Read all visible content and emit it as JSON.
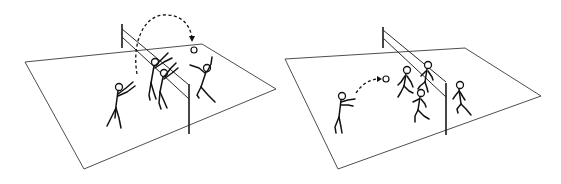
{
  "illustration": {
    "title": "",
    "panels": [
      {
        "id": "left",
        "description": "Volleyball spike/block at the net: one player sets, two players block at the net, one attacker on far side jumps for the ball",
        "players": 4,
        "ball": true,
        "trajectory": "dashed high arc over net with arrowhead down to ball"
      },
      {
        "id": "right",
        "description": "Volleyball pass: player on left passes the ball in a short dashed arc toward teammates near the net; one player on the far side of net",
        "players": 5,
        "ball": true,
        "trajectory": "short dashed arc with arrowhead toward ball"
      }
    ],
    "colors": {
      "background": "#ffffff",
      "line": "#111111"
    }
  }
}
